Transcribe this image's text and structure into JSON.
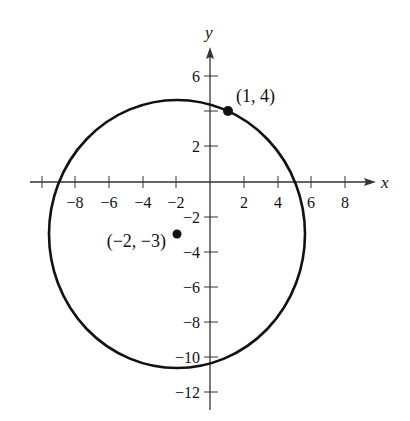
{
  "figure": {
    "x_axis_label": "x",
    "y_axis_label": "y",
    "x_ticks": [
      {
        "value": -10,
        "label": ""
      },
      {
        "value": -8,
        "label": "−8"
      },
      {
        "value": -6,
        "label": "−6"
      },
      {
        "value": -4,
        "label": "−4"
      },
      {
        "value": -2,
        "label": "−2"
      },
      {
        "value": 2,
        "label": "2"
      },
      {
        "value": 4,
        "label": "4"
      },
      {
        "value": 6,
        "label": "6"
      },
      {
        "value": 8,
        "label": "8"
      }
    ],
    "y_ticks": [
      {
        "value": 6,
        "label": "6"
      },
      {
        "value": 4,
        "label": ""
      },
      {
        "value": 2,
        "label": "2"
      },
      {
        "value": -2,
        "label": "−2"
      },
      {
        "value": -4,
        "label": "−4"
      },
      {
        "value": -6,
        "label": "−6"
      },
      {
        "value": -8,
        "label": "−8"
      },
      {
        "value": -10,
        "label": "−10"
      },
      {
        "value": -12,
        "label": "−12"
      }
    ],
    "circle": {
      "center_x": -2,
      "center_y": -3,
      "radius": 7.62
    },
    "points": [
      {
        "x": 1,
        "y": 4,
        "label": "(1, 4)"
      },
      {
        "x": -2,
        "y": -3,
        "label": "(−2, −3)"
      }
    ]
  }
}
